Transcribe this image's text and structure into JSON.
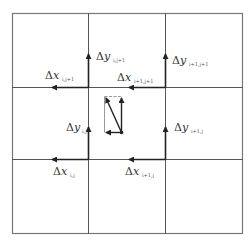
{
  "diagram": {
    "title": "",
    "grid": {
      "rows": 3,
      "cols": 3
    },
    "colors": {
      "grid_line": "#555555",
      "arrow": "#222222",
      "center_box": "#888888"
    },
    "labels": {
      "dx_i_j1": {
        "delta": "Δ",
        "var": "x",
        "sub": "i,j+1"
      },
      "dy_i_j1": {
        "delta": "Δ",
        "var": "y",
        "sub": "i,j+1"
      },
      "dy_i1_j1": {
        "delta": "Δ",
        "var": "y",
        "sub": "i+1,j+1"
      },
      "dx_i1_j1": {
        "delta": "Δ",
        "var": "x",
        "sub": "i+1,j+1"
      },
      "dy_i_j": {
        "delta": "Δ",
        "var": "y",
        "sub": "i,j"
      },
      "dy_i1_j": {
        "delta": "Δ",
        "var": "y",
        "sub": "i+1,j"
      },
      "dx_i_j": {
        "delta": "Δ",
        "var": "x",
        "sub": "i,j"
      },
      "dx_i1_j": {
        "delta": "Δ",
        "var": "x",
        "sub": "i+1,j"
      }
    }
  }
}
